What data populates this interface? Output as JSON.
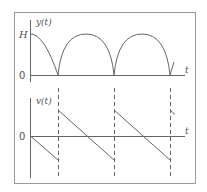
{
  "figure": {
    "top_plot": {
      "y_label": "y(t)",
      "x_label": "t",
      "y_tick_top": "H",
      "y_tick_zero": "0",
      "description": "Rectified sinusoid arches from H down to 0, three arches repeated"
    },
    "bottom_plot": {
      "y_label": "v(t)",
      "x_label": "t",
      "y_tick_zero": "0",
      "description": "Sawtooth linearly decreasing with upward jumps at each zero of y(t), marked by dashed vertical lines"
    },
    "colors": {
      "line": "#666666",
      "frame": "#999999",
      "background": "#ffffff"
    }
  }
}
